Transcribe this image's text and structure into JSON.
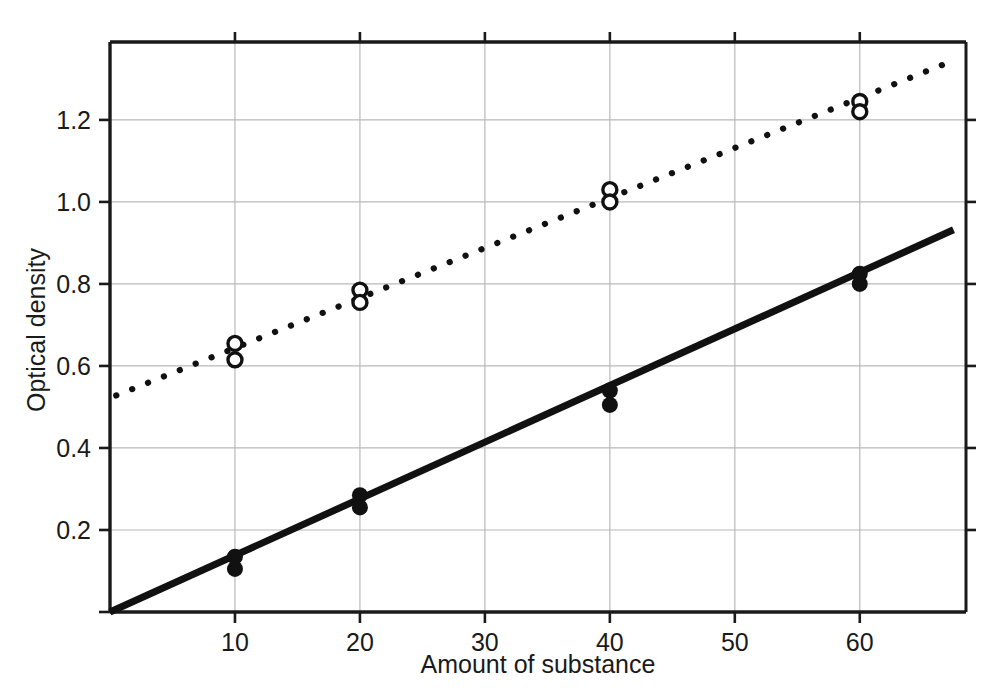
{
  "chart_data": {
    "type": "scatter",
    "title": "",
    "xlabel": "Amount of substance",
    "ylabel": "Optical density",
    "xlim": [
      0,
      68.5
    ],
    "ylim": [
      0,
      1.39
    ],
    "xticks": [
      10,
      20,
      30,
      40,
      50,
      60
    ],
    "xtick_labels": [
      "10",
      "20",
      "30",
      "40",
      "50",
      "60"
    ],
    "yticks": [
      0.2,
      0.4,
      0.6,
      0.8,
      1.0,
      1.2
    ],
    "ytick_labels": [
      "0.2",
      "0.4",
      "0.6",
      "0.8",
      "1.0",
      "1.2"
    ],
    "grid": true,
    "legend": "none",
    "series": [
      {
        "name": "open-circle-series",
        "marker": "open-circle",
        "line_style": "dotted",
        "x": [
          10,
          10,
          20,
          20,
          40,
          40,
          60,
          60
        ],
        "y": [
          0.655,
          0.615,
          0.785,
          0.755,
          1.03,
          1.0,
          1.245,
          1.22
        ],
        "fit_line": {
          "x_start": 0.5,
          "y_start": 0.528,
          "x_end": 67.5,
          "y_end": 1.345,
          "slope": 0.0122,
          "intercept": 0.522
        }
      },
      {
        "name": "filled-circle-series",
        "marker": "filled-circle",
        "line_style": "solid",
        "x": [
          10,
          10,
          20,
          20,
          40,
          40,
          60,
          60
        ],
        "y": [
          0.135,
          0.105,
          0.285,
          0.255,
          0.54,
          0.505,
          0.825,
          0.8
        ],
        "fit_line": {
          "x_start": 0.0,
          "y_start": 0.0,
          "x_end": 67.5,
          "y_end": 0.932,
          "slope": 0.0138,
          "intercept": 0.0
        }
      }
    ]
  },
  "axes": {
    "x_title": "Amount of substance",
    "y_title": "Optical density"
  }
}
